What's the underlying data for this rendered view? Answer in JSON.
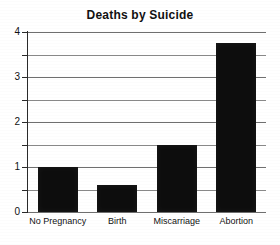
{
  "chart_data": {
    "type": "bar",
    "title": "Deaths by Suicide",
    "xlabel": "",
    "ylabel": "",
    "categories": [
      "No Pregnancy",
      "Birth",
      "Miscarriage",
      "Abortion"
    ],
    "values": [
      1.0,
      0.6,
      1.5,
      3.75
    ],
    "ylim": [
      0,
      4
    ],
    "ytick_labels": [
      "0",
      "1",
      "2",
      "3",
      "4"
    ],
    "ytick_values": [
      0,
      1,
      2,
      3,
      4
    ],
    "gridline_values": [
      0,
      0.5,
      1,
      1.5,
      2,
      2.5,
      3,
      3.5,
      4
    ],
    "grid": true,
    "legend": false,
    "bar_color": "#0d0d0d",
    "grid_color": "#8a8a8a",
    "axis_color": "#2a2a2a",
    "background_color": "#ffffff"
  }
}
